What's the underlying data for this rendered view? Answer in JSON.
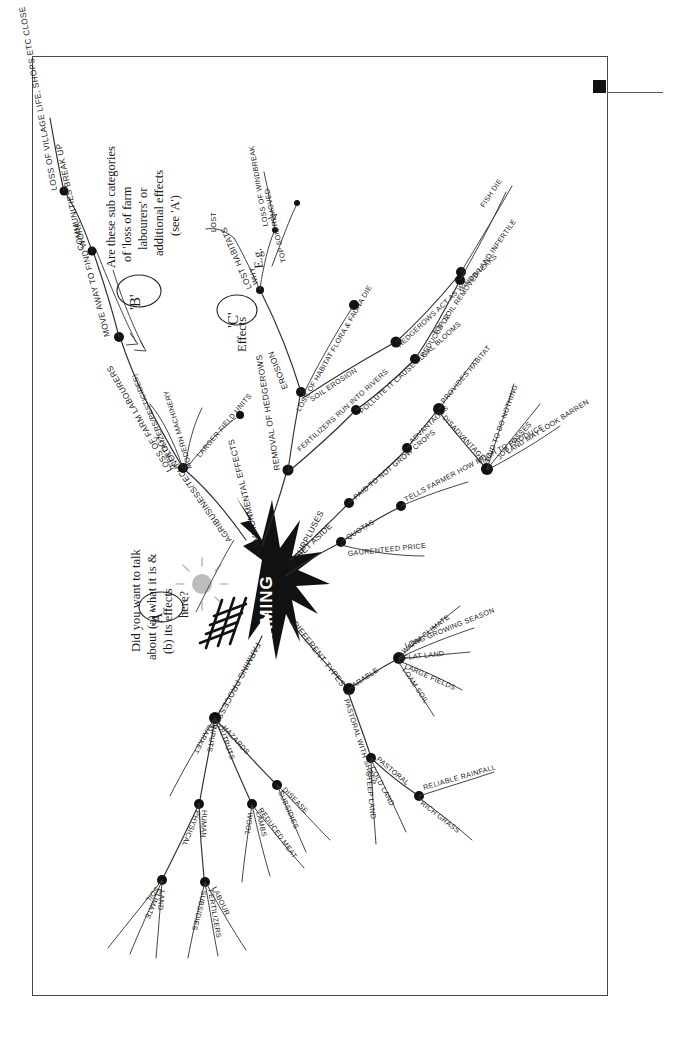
{
  "document": {
    "type": "hand-drawn mind map photocopy with printed caption",
    "center_label": "FARMING",
    "caption": "when teachers can get access to not only the result but also the structure of pupils' thinking, they are more able to give useful, directed, specific feedback – see A, B, C",
    "marker_square": "black-square-marker"
  },
  "annotations": [
    {
      "id": "A",
      "marker": "'A'",
      "text": "Did you want to talk about (a) what it is & (b) its effects here?"
    },
    {
      "id": "B",
      "marker": "'B'",
      "text": "Are these sub categories of 'loss of farm labourers' or additional effects (see 'A')"
    },
    {
      "id": "C",
      "marker": "'C'",
      "text": "Effects"
    }
  ],
  "branches": {
    "agribusiness": {
      "label": "AGRIBUSINESS/TECHNOLOGY",
      "children": [
        {
          "label": "LOSS OF FARM LABOURERS",
          "children": [
            {
              "label": "MOVE AWAY TO FIND WORK"
            },
            {
              "label": "COMMUNITIES BREAK UP"
            },
            {
              "label": "LOSS OF VILLAGE LIFE, SHOPS ETC CLOSE"
            }
          ]
        },
        {
          "label": "(FERTILIZERS/PESTICIDES)"
        },
        {
          "label": "MODERN MACHINERY"
        },
        {
          "label": "LARGER FIELD UNITS"
        }
      ]
    },
    "environmental": {
      "label": "ENVIRONMENTAL EFFECTS",
      "children": [
        {
          "label": "REMOVAL OF HEDGEROWS",
          "children": [
            {
              "label": "LOST HABITATS"
            },
            {
              "label": "EROSION",
              "children": [
                {
                  "label": "WHY"
                },
                {
                  "label": "LOSS OF WINDBREAK"
                },
                {
                  "label": "E.g."
                },
                {
                  "label": "TOP SOIL REMOVED"
                }
              ]
            },
            {
              "label": "LOSS OF HABITAT FLORA & FAUNA DIE"
            },
            {
              "label": "SOIL EROSION"
            },
            {
              "label": "HEDGEROWS ACT AS WINDBREAKS"
            },
            {
              "label": "TOP SOIL REMOVED LAND INFERTILE"
            }
          ]
        },
        {
          "label": "FERTILIZERS RUN INTO RIVERS",
          "children": [
            {
              "label": "POLLUTE IT CAUSE ALGAL BLOOMS"
            },
            {
              "label": "REDUCES O2"
            },
            {
              "label": "FISH DIE"
            }
          ]
        }
      ]
    },
    "set_aside": {
      "label": "SET ASIDE",
      "children": [
        {
          "label": "PAID TO NOT GROW CROPS",
          "children": [
            {
              "label": "ADVANTAGES",
              "children": [
                {
                  "label": "PROVIDES HABITAT"
                }
              ]
            },
            {
              "label": "DISADVANTAGES",
              "children": [
                {
                  "label": "PAID TO DO NOTHING"
                },
                {
                  "label": "JOB LOSSES"
                },
                {
                  "label": "LAND MAY LOOK BARREN"
                }
              ]
            }
          ]
        }
      ]
    },
    "food_surpluses": {
      "label": "FOOD SURPLUSES",
      "children": [
        {
          "label": "QUOTAS",
          "children": [
            {
              "label": "TELLS FARMER HOW MUCH TO PRODUCE"
            }
          ]
        },
        {
          "label": "GAURENTEED PRICE"
        }
      ]
    },
    "different_types": {
      "label": "DIFFERENT TYPES",
      "children": [
        {
          "label": "ARABLE",
          "children": [
            {
              "label": "WARM CLIMATE"
            },
            {
              "label": "LONG GROWING SEASON"
            },
            {
              "label": "FLAT LAND"
            },
            {
              "label": "LARGE FIELDS"
            },
            {
              "label": "LOAM SOIL"
            }
          ]
        },
        {
          "label": "PASTORAL WITH SHEEP",
          "children": [
            {
              "label": "PASTORAL",
              "children": [
                {
                  "label": "RELIABLE RAINFALL"
                },
                {
                  "label": "RICH GRASS"
                }
              ]
            },
            {
              "label": "COLD LAND"
            },
            {
              "label": "STEEP LAND"
            }
          ]
        }
      ]
    },
    "farming_processes": {
      "label": "FARMING PROCESSES",
      "children": [
        {
          "label": "MARKET"
        },
        {
          "label": "INPUTS",
          "children": [
            {
              "label": "PHYSICAL",
              "children": [
                {
                  "label": "SOIL"
                },
                {
                  "label": "CLIMATE"
                },
                {
                  "label": "LAND"
                }
              ]
            },
            {
              "label": "HUMAN",
              "children": [
                {
                  "label": "SUBSIDIES"
                },
                {
                  "label": "FERTILIZERS"
                },
                {
                  "label": "LABOUR"
                }
              ]
            }
          ]
        },
        {
          "label": "OUTPUTS",
          "children": [
            {
              "label": "WOOL"
            },
            {
              "label": "LAMBS"
            },
            {
              "label": "REDUCED MEAT"
            }
          ]
        },
        {
          "label": "HAZARDS",
          "children": [
            {
              "label": "SUBSIDIES"
            },
            {
              "label": "DISEASE"
            }
          ]
        }
      ]
    }
  },
  "colors": {
    "ink": "#1a1a1a",
    "paper": "#ffffff",
    "border": "#4a4a4a",
    "caption_text": "#2b2b2b",
    "sun": "#bdbdbd"
  }
}
